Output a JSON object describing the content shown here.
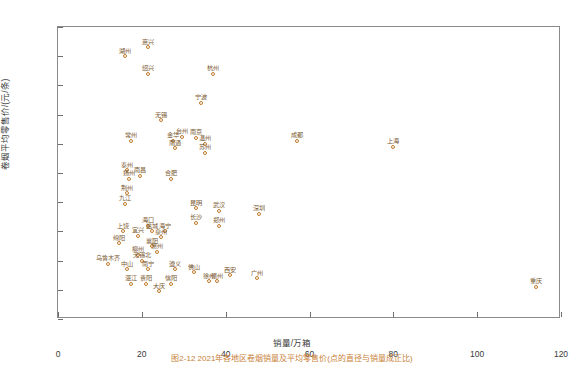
{
  "chart_data": {
    "type": "scatter",
    "title": "",
    "xlabel": "销量/万箱",
    "ylabel": "卷烟平均零售价/(元/条)",
    "xlim": [
      0,
      120
    ],
    "ylim": [
      160,
      260
    ],
    "xticks": [
      0,
      20,
      40,
      60,
      80,
      100,
      120
    ],
    "yticks": [
      160,
      170,
      180,
      190,
      200,
      210,
      220,
      230,
      240,
      250,
      260
    ],
    "grid": false,
    "legend": null,
    "marker_color": "#c07a2a",
    "label_color": "#7a5a32",
    "points": [
      {
        "label": "嘉兴",
        "x": 21.5,
        "y": 253
      },
      {
        "label": "湖州",
        "x": 16.0,
        "y": 250
      },
      {
        "label": "绍兴",
        "x": 21.5,
        "y": 244
      },
      {
        "label": "杭州",
        "x": 37.0,
        "y": 244
      },
      {
        "label": "宁波",
        "x": 34.0,
        "y": 234
      },
      {
        "label": "无锡",
        "x": 24.5,
        "y": 228
      },
      {
        "label": "台州",
        "x": 29.5,
        "y": 222.5
      },
      {
        "label": "南京",
        "x": 33.0,
        "y": 222
      },
      {
        "label": "常州",
        "x": 17.5,
        "y": 221
      },
      {
        "label": "金华",
        "x": 27.5,
        "y": 221
      },
      {
        "label": "温州",
        "x": 35.0,
        "y": 220
      },
      {
        "label": "成都",
        "x": 57.0,
        "y": 221
      },
      {
        "label": "上海",
        "x": 80.0,
        "y": 219
      },
      {
        "label": "南通",
        "x": 28.0,
        "y": 218.5
      },
      {
        "label": "苏州",
        "x": 35.0,
        "y": 217
      },
      {
        "label": "泰州",
        "x": 16.5,
        "y": 211
      },
      {
        "label": "南昌",
        "x": 19.5,
        "y": 209
      },
      {
        "label": "扬州",
        "x": 17.0,
        "y": 208
      },
      {
        "label": "合肥",
        "x": 27.0,
        "y": 208
      },
      {
        "label": "荆州",
        "x": 16.5,
        "y": 203
      },
      {
        "label": "九江",
        "x": 16.0,
        "y": 199.5
      },
      {
        "label": "昆明",
        "x": 33.0,
        "y": 198
      },
      {
        "label": "武汉",
        "x": 38.5,
        "y": 197
      },
      {
        "label": "长沙",
        "x": 33.0,
        "y": 193
      },
      {
        "label": "深圳",
        "x": 48.0,
        "y": 196
      },
      {
        "label": "郑州",
        "x": 38.5,
        "y": 192
      },
      {
        "label": "海口",
        "x": 21.5,
        "y": 192
      },
      {
        "label": "上饶",
        "x": 15.5,
        "y": 190
      },
      {
        "label": "盐城",
        "x": 22.5,
        "y": 190
      },
      {
        "label": "海宁",
        "x": 25.5,
        "y": 190
      },
      {
        "label": "宜兴",
        "x": 19.0,
        "y": 188.5
      },
      {
        "label": "泉州",
        "x": 24.5,
        "y": 188
      },
      {
        "label": "绵阳",
        "x": 14.5,
        "y": 186
      },
      {
        "label": "襄阳",
        "x": 22.5,
        "y": 185
      },
      {
        "label": "惠州",
        "x": 23.5,
        "y": 183
      },
      {
        "label": "柳州",
        "x": 19.0,
        "y": 182
      },
      {
        "label": "乌鲁木齐",
        "x": 12.0,
        "y": 179
      },
      {
        "label": "无锡北",
        "x": 20.0,
        "y": 180
      },
      {
        "label": "中山",
        "x": 16.5,
        "y": 177
      },
      {
        "label": "南宁",
        "x": 21.5,
        "y": 177
      },
      {
        "label": "遵义",
        "x": 28.0,
        "y": 177
      },
      {
        "label": "佛山",
        "x": 32.5,
        "y": 176
      },
      {
        "label": "西安",
        "x": 41.0,
        "y": 175
      },
      {
        "label": "广州",
        "x": 47.5,
        "y": 174
      },
      {
        "label": "赣州",
        "x": 38.0,
        "y": 173
      },
      {
        "label": "徐州",
        "x": 36.0,
        "y": 173
      },
      {
        "label": "湛江",
        "x": 17.5,
        "y": 172
      },
      {
        "label": "贵阳",
        "x": 21.0,
        "y": 172
      },
      {
        "label": "信阳",
        "x": 27.0,
        "y": 172
      },
      {
        "label": "大庆",
        "x": 24.0,
        "y": 169.5
      },
      {
        "label": "重庆",
        "x": 114.0,
        "y": 171
      }
    ]
  },
  "caption": {
    "text": "图2-12  2021年各地区卷烟销量及平均零售价(点的直径与销量成正比)"
  }
}
